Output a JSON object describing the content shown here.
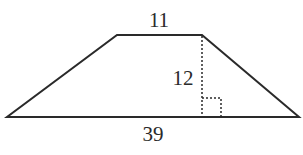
{
  "figure": {
    "shape": "trapezoid",
    "labels": {
      "top_base": "11",
      "height": "12",
      "bottom_base": "39"
    },
    "colors": {
      "stroke": "#2a2a2a",
      "background": "#ffffff"
    }
  }
}
